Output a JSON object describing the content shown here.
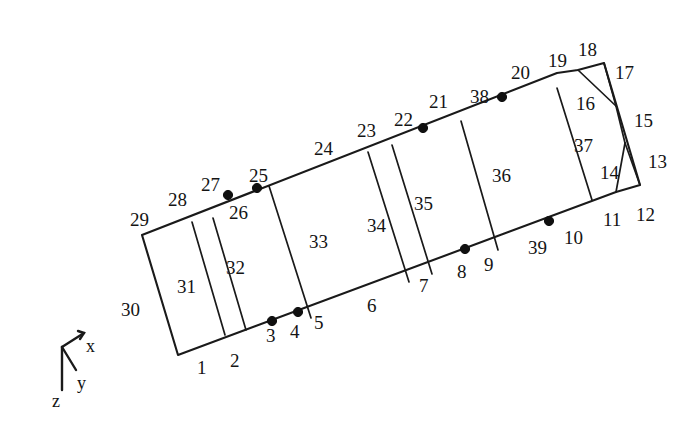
{
  "figure": {
    "type": "panel-mesh-diagram",
    "background_color": "#ffffff",
    "line_color": "#1a1a1a",
    "node_color": "#101010"
  },
  "axis_triad": {
    "origin": [
      62,
      347
    ],
    "labels": [
      {
        "id": "axis-x",
        "text": "x",
        "x": 86,
        "y": 337
      },
      {
        "id": "axis-y",
        "text": "y",
        "x": 77,
        "y": 374
      },
      {
        "id": "axis-z",
        "text": "z",
        "x": 52,
        "y": 392
      }
    ],
    "arms": [
      {
        "id": "arm-x",
        "from": [
          62,
          347
        ],
        "to": [
          84,
          333
        ]
      },
      {
        "id": "arm-y",
        "from": [
          62,
          347
        ],
        "to": [
          76,
          370
        ]
      },
      {
        "id": "arm-z",
        "from": [
          62,
          347
        ],
        "to": [
          62,
          390
        ]
      }
    ]
  },
  "outline": {
    "points": "142,235 178,355 616,192 640,185 604,63 578,70 557,73",
    "closed": true
  },
  "dividers": [
    {
      "id": "divider-31-32",
      "from": [
        192,
        222
      ],
      "to": [
        225,
        335
      ]
    },
    {
      "id": "divider-32a",
      "from": [
        213,
        218
      ],
      "to": [
        246,
        330
      ]
    },
    {
      "id": "divider-32-33",
      "from": [
        269,
        186
      ],
      "to": [
        311,
        318
      ]
    },
    {
      "id": "divider-33-34",
      "from": [
        368,
        152
      ],
      "to": [
        409,
        282
      ]
    },
    {
      "id": "divider-34-35",
      "from": [
        392,
        145
      ],
      "to": [
        432,
        274
      ]
    },
    {
      "id": "divider-35-36",
      "from": [
        461,
        121
      ],
      "to": [
        498,
        250
      ]
    },
    {
      "id": "divider-36-37",
      "from": [
        557,
        88
      ],
      "to": [
        592,
        200
      ]
    },
    {
      "id": "segment-16",
      "from": [
        578,
        70
      ],
      "to": [
        616,
        106
      ]
    },
    {
      "id": "segment-15",
      "from": [
        604,
        63
      ],
      "to": [
        616,
        106
      ]
    },
    {
      "id": "segment-15b",
      "from": [
        616,
        106
      ],
      "to": [
        625,
        143
      ]
    },
    {
      "id": "triangle-14-13",
      "from": [
        625,
        143
      ],
      "to": [
        616,
        192
      ]
    },
    {
      "id": "triangle-13",
      "from": [
        625,
        143
      ],
      "to": [
        640,
        185
      ]
    }
  ],
  "nodes": [
    {
      "id": "node-26",
      "cx": 228,
      "cy": 195
    },
    {
      "id": "node-25",
      "cx": 257,
      "cy": 188
    },
    {
      "id": "node-3",
      "cx": 272,
      "cy": 321
    },
    {
      "id": "node-4",
      "cx": 298,
      "cy": 312
    },
    {
      "id": "node-22",
      "cx": 423,
      "cy": 128
    },
    {
      "id": "node-38",
      "cx": 502,
      "cy": 97
    },
    {
      "id": "node-8",
      "cx": 465,
      "cy": 249
    },
    {
      "id": "node-39",
      "cx": 549,
      "cy": 221
    }
  ],
  "labels": [
    {
      "id": "label-1",
      "text": "1",
      "x": 197,
      "y": 358
    },
    {
      "id": "label-2",
      "text": "2",
      "x": 230,
      "y": 351
    },
    {
      "id": "label-3",
      "text": "3",
      "x": 266,
      "y": 326
    },
    {
      "id": "label-4",
      "text": "4",
      "x": 290,
      "y": 322
    },
    {
      "id": "label-5",
      "text": "5",
      "x": 314,
      "y": 313
    },
    {
      "id": "label-6",
      "text": "6",
      "x": 367,
      "y": 296
    },
    {
      "id": "label-7",
      "text": "7",
      "x": 419,
      "y": 276
    },
    {
      "id": "label-8",
      "text": "8",
      "x": 457,
      "y": 262
    },
    {
      "id": "label-9",
      "text": "9",
      "x": 484,
      "y": 255
    },
    {
      "id": "label-10",
      "text": "10",
      "x": 564,
      "y": 228
    },
    {
      "id": "label-11",
      "text": "11",
      "x": 603,
      "y": 210
    },
    {
      "id": "label-12",
      "text": "12",
      "x": 636,
      "y": 205
    },
    {
      "id": "label-13",
      "text": "13",
      "x": 648,
      "y": 152
    },
    {
      "id": "label-14",
      "text": "14",
      "x": 600,
      "y": 163
    },
    {
      "id": "label-15",
      "text": "15",
      "x": 634,
      "y": 111
    },
    {
      "id": "label-16",
      "text": "16",
      "x": 576,
      "y": 94
    },
    {
      "id": "label-17",
      "text": "17",
      "x": 615,
      "y": 63
    },
    {
      "id": "label-18",
      "text": "18",
      "x": 578,
      "y": 40
    },
    {
      "id": "label-19",
      "text": "19",
      "x": 548,
      "y": 51
    },
    {
      "id": "label-20",
      "text": "20",
      "x": 511,
      "y": 63
    },
    {
      "id": "label-21",
      "text": "21",
      "x": 429,
      "y": 92
    },
    {
      "id": "label-22",
      "text": "22",
      "x": 394,
      "y": 110
    },
    {
      "id": "label-23",
      "text": "23",
      "x": 357,
      "y": 121
    },
    {
      "id": "label-24",
      "text": "24",
      "x": 314,
      "y": 139
    },
    {
      "id": "label-25",
      "text": "25",
      "x": 249,
      "y": 166
    },
    {
      "id": "label-26",
      "text": "26",
      "x": 229,
      "y": 203
    },
    {
      "id": "label-27",
      "text": "27",
      "x": 201,
      "y": 175
    },
    {
      "id": "label-28",
      "text": "28",
      "x": 168,
      "y": 190
    },
    {
      "id": "label-29",
      "text": "29",
      "x": 130,
      "y": 210
    },
    {
      "id": "label-30",
      "text": "30",
      "x": 121,
      "y": 300
    },
    {
      "id": "label-31",
      "text": "31",
      "x": 177,
      "y": 277
    },
    {
      "id": "label-32",
      "text": "32",
      "x": 226,
      "y": 258
    },
    {
      "id": "label-33",
      "text": "33",
      "x": 309,
      "y": 232
    },
    {
      "id": "label-34",
      "text": "34",
      "x": 367,
      "y": 216
    },
    {
      "id": "label-35",
      "text": "35",
      "x": 414,
      "y": 194
    },
    {
      "id": "label-36",
      "text": "36",
      "x": 492,
      "y": 166
    },
    {
      "id": "label-37",
      "text": "37",
      "x": 574,
      "y": 136
    },
    {
      "id": "label-38",
      "text": "38",
      "x": 470,
      "y": 87
    },
    {
      "id": "label-39",
      "text": "39",
      "x": 528,
      "y": 238
    }
  ]
}
